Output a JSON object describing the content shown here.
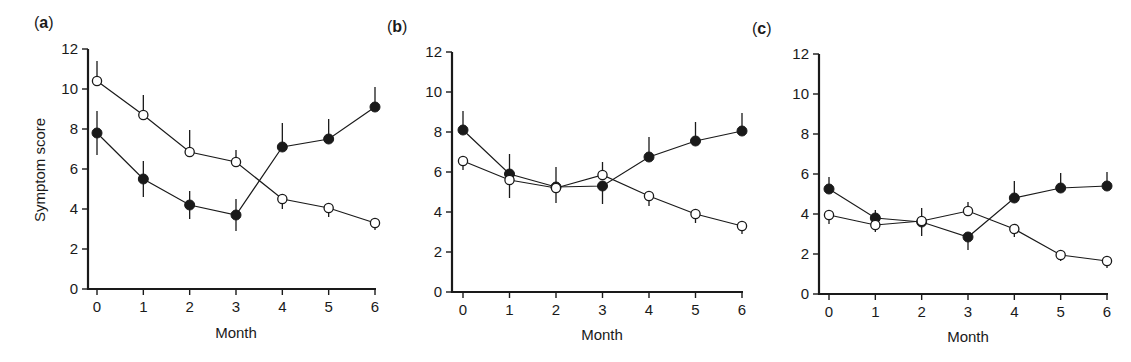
{
  "chart_data": [
    {
      "type": "line",
      "panel": "a",
      "title": "",
      "xlabel": "Month",
      "ylabel": "Symptom score",
      "x": [
        0,
        1,
        2,
        3,
        4,
        5,
        6
      ],
      "ylim": [
        0,
        12
      ],
      "yticks": [
        0,
        2,
        4,
        6,
        8,
        10,
        12
      ],
      "xticks": [
        0,
        1,
        2,
        3,
        4,
        5,
        6
      ],
      "grid": false,
      "legend": null,
      "series": [
        {
          "name": "filled circles",
          "marker": "filled",
          "values": [
            7.8,
            5.5,
            4.2,
            3.7,
            7.1,
            7.5,
            9.1
          ],
          "error_up": [
            1.1,
            0.9,
            0.7,
            0.8,
            1.2,
            1.0,
            1.0
          ],
          "error_down": [
            1.1,
            0.9,
            0.7,
            0.8,
            0,
            0,
            0
          ]
        },
        {
          "name": "open circles",
          "marker": "open",
          "values": [
            10.4,
            8.7,
            6.85,
            6.35,
            4.5,
            4.05,
            3.3
          ],
          "error_up": [
            1.0,
            1.0,
            1.1,
            0.6,
            0,
            0,
            0
          ],
          "error_down": [
            0,
            0,
            0,
            0,
            0.5,
            0.45,
            0.35
          ]
        }
      ]
    },
    {
      "type": "line",
      "panel": "b",
      "title": "",
      "xlabel": "Month",
      "ylabel": "",
      "x": [
        0,
        1,
        2,
        3,
        4,
        5,
        6
      ],
      "ylim": [
        0,
        12
      ],
      "yticks": [
        0,
        2,
        4,
        6,
        8,
        10,
        12
      ],
      "xticks": [
        0,
        1,
        2,
        3,
        4,
        5,
        6
      ],
      "grid": false,
      "legend": null,
      "series": [
        {
          "name": "filled circles",
          "marker": "filled",
          "values": [
            8.1,
            5.9,
            5.25,
            5.3,
            6.75,
            7.55,
            8.05
          ],
          "error_up": [
            0.95,
            1.0,
            1.0,
            0,
            1.0,
            0.95,
            0.9
          ],
          "error_down": [
            0,
            0,
            0.8,
            0.9,
            0,
            0,
            0
          ]
        },
        {
          "name": "open circles",
          "marker": "open",
          "values": [
            6.55,
            5.6,
            5.2,
            5.85,
            4.8,
            3.9,
            3.3
          ],
          "error_up": [
            0,
            0,
            0,
            0.65,
            0,
            0,
            0
          ],
          "error_down": [
            0.45,
            0.9,
            0,
            0,
            0.5,
            0.45,
            0.4
          ]
        }
      ]
    },
    {
      "type": "line",
      "panel": "c",
      "title": "",
      "xlabel": "Month",
      "ylabel": "",
      "x": [
        0,
        1,
        2,
        3,
        4,
        5,
        6
      ],
      "ylim": [
        0,
        12
      ],
      "yticks": [
        0,
        2,
        4,
        6,
        8,
        10,
        12
      ],
      "xticks": [
        0,
        1,
        2,
        3,
        4,
        5,
        6
      ],
      "grid": false,
      "legend": null,
      "series": [
        {
          "name": "filled circles",
          "marker": "filled",
          "values": [
            5.25,
            3.8,
            3.6,
            2.85,
            4.8,
            5.3,
            5.4
          ],
          "error_up": [
            0.6,
            0.4,
            0.7,
            0,
            0.85,
            0.75,
            0.7
          ],
          "error_down": [
            0,
            0,
            0.7,
            0.65,
            0,
            0,
            0
          ]
        },
        {
          "name": "open circles",
          "marker": "open",
          "values": [
            3.95,
            3.45,
            3.65,
            4.15,
            3.25,
            1.95,
            1.65
          ],
          "error_up": [
            0,
            0,
            0,
            0.45,
            0,
            0,
            0
          ],
          "error_down": [
            0.45,
            0.35,
            0,
            0,
            0.4,
            0.3,
            0.35
          ]
        }
      ]
    }
  ],
  "panels": [
    {
      "label_open": "(",
      "label_letter": "a",
      "label_close": ")",
      "ylabel": "Symptom score",
      "xlabel": "Month"
    },
    {
      "label_open": "(",
      "label_letter": "b",
      "label_close": ")",
      "ylabel": "",
      "xlabel": "Month"
    },
    {
      "label_open": "(",
      "label_letter": "c",
      "label_close": ")",
      "ylabel": "",
      "xlabel": "Month"
    }
  ],
  "colors": {
    "ink": "#1a1a1a",
    "background": "#ffffff",
    "open_fill": "#ffffff"
  }
}
